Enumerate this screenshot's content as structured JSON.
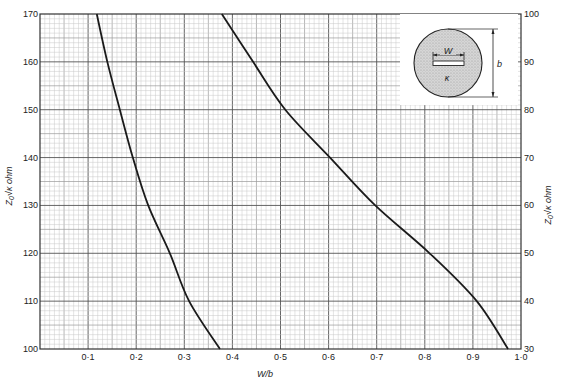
{
  "chart_data": {
    "type": "line",
    "title": "",
    "xlabel": "W/b",
    "ylabel_left": "Z0√κ ohm",
    "ylabel_right": "Z0√κ ohm",
    "xlim": [
      0,
      1.0
    ],
    "ylim_left": [
      100,
      170
    ],
    "ylim_right": [
      30,
      100
    ],
    "x_ticks": [
      "0·1",
      "0·2",
      "0·3",
      "0·4",
      "0·5",
      "0·6",
      "0·7",
      "0·8",
      "0·9",
      "1·0"
    ],
    "x_tick_values": [
      0.1,
      0.2,
      0.3,
      0.4,
      0.5,
      0.6,
      0.7,
      0.8,
      0.9,
      1.0
    ],
    "y_ticks_left": [
      100,
      110,
      120,
      130,
      140,
      150,
      160,
      170
    ],
    "y_ticks_right": [
      30,
      40,
      50,
      60,
      70,
      80,
      90,
      100
    ],
    "grid": {
      "on": true,
      "minor_x": 0.01,
      "minor_y": 1,
      "mid_x": 0.05,
      "mid_y": 5,
      "major_x": 0.1,
      "major_y": 10
    },
    "legend": null,
    "series": [
      {
        "name": "Left scale curve (Z0√κ 100–170 ohm)",
        "axis": "left",
        "x": [
          0.118,
          0.14,
          0.166,
          0.193,
          0.225,
          0.27,
          0.31,
          0.374
        ],
        "y": [
          170,
          160,
          150,
          140,
          130,
          120,
          110,
          100
        ]
      },
      {
        "name": "Right scale curve (Z0√κ 30–100 ohm)",
        "axis": "right",
        "x": [
          0.378,
          0.443,
          0.51,
          0.603,
          0.697,
          0.81,
          0.908,
          0.973
        ],
        "y": [
          100,
          90,
          80,
          70,
          60,
          50,
          40,
          30
        ]
      }
    ],
    "annotations": {
      "inset_diagram": {
        "description": "Circular cross-section filled with dielectric κ containing a thin flat strip of width W; outer diameter b",
        "labels": [
          "W",
          "κ",
          "b"
        ]
      }
    }
  },
  "inset": {
    "w_label": "W",
    "kappa_label": "κ",
    "b_label": "b"
  },
  "axes": {
    "x_label": "W/b",
    "y_left_label_main": "Z",
    "y_left_label_sub": "0",
    "y_left_label_rest": "√κ  ohm",
    "y_right_label_main": "Z",
    "y_right_label_sub": "0",
    "y_right_label_rest": "√κ  ohm"
  },
  "colors": {
    "grid_minor": "#c8c8c8",
    "grid_mid": "#9a9a9a",
    "grid_major": "#555555",
    "curve": "#1a1a1a",
    "inset_fill": "#cfcfcf"
  }
}
